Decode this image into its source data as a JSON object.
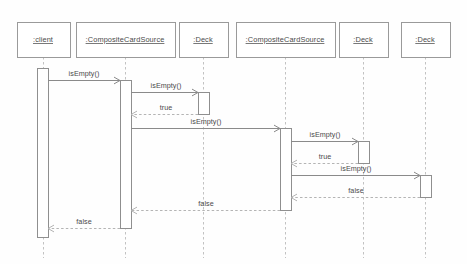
{
  "diagram": {
    "kind": "uml-sequence-diagram",
    "background_color": "#fefefe",
    "box_fill": "#ffffff",
    "box_stroke": "#9a9a9a",
    "lifeline_color": "#c2c2c2",
    "call_color": "#8a8a8a",
    "return_color": "#b4b4b4",
    "text_color": "#4a4a4a"
  },
  "lifelines": [
    {
      "id": "client",
      "label": ":client",
      "x": 43,
      "box_x": 17,
      "box_w": 53,
      "box_y": 22,
      "box_h": 35
    },
    {
      "id": "comp1",
      "label": ":CompositeCardSource",
      "x": 125,
      "box_x": 76,
      "box_w": 99,
      "box_y": 22,
      "box_h": 35
    },
    {
      "id": "deck1",
      "label": ":Deck",
      "x": 203,
      "box_x": 179,
      "box_w": 49,
      "box_y": 22,
      "box_h": 35
    },
    {
      "id": "comp2",
      "label": ":CompositeCardSource",
      "x": 285,
      "box_x": 236,
      "box_w": 99,
      "box_y": 22,
      "box_h": 35
    },
    {
      "id": "deck2",
      "label": ":Deck",
      "x": 363,
      "box_x": 339,
      "box_w": 49,
      "box_y": 22,
      "box_h": 35
    },
    {
      "id": "deck3",
      "label": ":Deck",
      "x": 425,
      "box_x": 401,
      "box_w": 49,
      "box_y": 22,
      "box_h": 35
    }
  ],
  "activations": [
    {
      "id": "act-client",
      "lifeline": "client",
      "x": 37,
      "y": 68,
      "w": 11,
      "h": 169
    },
    {
      "id": "act-comp1",
      "lifeline": "comp1",
      "x": 120,
      "y": 80,
      "w": 11,
      "h": 148
    },
    {
      "id": "act-deck1",
      "lifeline": "deck1",
      "x": 198,
      "y": 92,
      "w": 11,
      "h": 22
    },
    {
      "id": "act-comp2",
      "lifeline": "comp2",
      "x": 280,
      "y": 128,
      "w": 11,
      "h": 82
    },
    {
      "id": "act-deck2",
      "lifeline": "deck2",
      "x": 358,
      "y": 141,
      "w": 11,
      "h": 22
    },
    {
      "id": "act-deck3",
      "lifeline": "deck3",
      "x": 420,
      "y": 175,
      "w": 11,
      "h": 22
    }
  ],
  "messages": [
    {
      "id": "m1",
      "label": "isEmpty()",
      "type": "call",
      "from_x": 48,
      "to_x": 120,
      "y": 80,
      "label_x": 84,
      "label_y": 76
    },
    {
      "id": "m2",
      "label": "isEmpty()",
      "type": "call",
      "from_x": 131,
      "to_x": 198,
      "y": 92,
      "label_x": 166,
      "label_y": 88
    },
    {
      "id": "m3",
      "label": "true",
      "type": "return",
      "from_x": 198,
      "to_x": 131,
      "y": 114,
      "label_x": 166,
      "label_y": 110
    },
    {
      "id": "m4",
      "label": "isEmpty()",
      "type": "call",
      "from_x": 131,
      "to_x": 280,
      "y": 128,
      "label_x": 206,
      "label_y": 124
    },
    {
      "id": "m5",
      "label": "isEmpty()",
      "type": "call",
      "from_x": 291,
      "to_x": 358,
      "y": 141,
      "label_x": 325,
      "label_y": 137
    },
    {
      "id": "m6",
      "label": "true",
      "type": "return",
      "from_x": 358,
      "to_x": 291,
      "y": 163,
      "label_x": 325,
      "label_y": 159
    },
    {
      "id": "m7",
      "label": "isEmpty()",
      "type": "call",
      "from_x": 291,
      "to_x": 420,
      "y": 175,
      "label_x": 356,
      "label_y": 171
    },
    {
      "id": "m8",
      "label": "false",
      "type": "return",
      "from_x": 420,
      "to_x": 291,
      "y": 197,
      "label_x": 356,
      "label_y": 193
    },
    {
      "id": "m9",
      "label": "false",
      "type": "return",
      "from_x": 280,
      "to_x": 131,
      "y": 210,
      "label_x": 206,
      "label_y": 206
    },
    {
      "id": "m10",
      "label": "false",
      "type": "return",
      "from_x": 120,
      "to_x": 48,
      "y": 228,
      "label_x": 84,
      "label_y": 224
    }
  ]
}
